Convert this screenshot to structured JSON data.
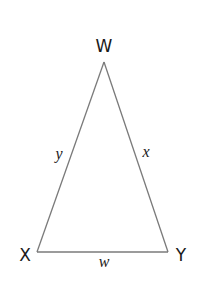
{
  "diagram": {
    "type": "triangle",
    "shape": "isosceles",
    "vertices": [
      {
        "id": "W",
        "label": "W",
        "x": 104,
        "y": 62
      },
      {
        "id": "X",
        "label": "X",
        "x": 37,
        "y": 252
      },
      {
        "id": "Y",
        "label": "Y",
        "x": 168,
        "y": 252
      }
    ],
    "sides": [
      {
        "from": "X",
        "to": "W",
        "label": "y"
      },
      {
        "from": "W",
        "to": "Y",
        "label": "x"
      },
      {
        "from": "X",
        "to": "Y",
        "label": "w"
      }
    ],
    "colors": {
      "edge": "#7a7a7a",
      "text": "#1a1a1a",
      "background": "#ffffff"
    }
  },
  "labels": {
    "vertex_w": "W",
    "vertex_x": "X",
    "vertex_y": "Y",
    "side_xw": "y",
    "side_wy": "x",
    "side_xy": "w"
  }
}
